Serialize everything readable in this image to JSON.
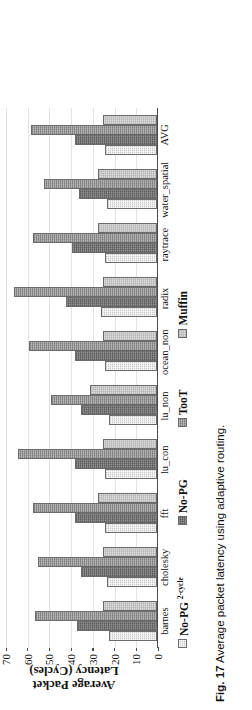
{
  "figure": {
    "caption_number": "Fig. 17",
    "caption_text": "Average packet latency using adaptive routing."
  },
  "axis": {
    "y_title_line1": "Average Packet",
    "y_title_line2": "Latency (Cycles)"
  },
  "legend": {
    "items": [
      {
        "label": "No-PG ",
        "sup": "2-cycle",
        "color": "#c8c8c8"
      },
      {
        "label": "No-PG",
        "sup": "",
        "color": "#6f6f6f"
      },
      {
        "label": "TooT",
        "sup": "",
        "color": "#8e8e8e"
      },
      {
        "label": "Muffin",
        "sup": "",
        "color": "#dcdcdc"
      }
    ]
  },
  "chart_data": {
    "type": "bar",
    "title": "",
    "xlabel": "",
    "ylabel": "Average Packet Latency (Cycles)",
    "ylim": [
      0,
      70
    ],
    "yticks": [
      0,
      10,
      20,
      30,
      40,
      50,
      60,
      70
    ],
    "ytick_labels": [
      "0",
      "10",
      "20",
      "30",
      "40",
      "50",
      "60",
      "70"
    ],
    "grid": true,
    "legend_position": "below",
    "categories": [
      "barnes",
      "cholesky",
      "fft",
      "lu_con",
      "lu_non",
      "ocean_non",
      "radix",
      "raytrace",
      "water_spatial",
      "AVG"
    ],
    "series": [
      {
        "name": "No-PG 2-cycle",
        "values": [
          22,
          23,
          24,
          24,
          22,
          24,
          26,
          24,
          23,
          24
        ]
      },
      {
        "name": "No-PG",
        "values": [
          37,
          35,
          38,
          38,
          35,
          38,
          42,
          39,
          36,
          38
        ]
      },
      {
        "name": "TooT",
        "values": [
          56,
          55,
          57,
          64,
          49,
          59,
          66,
          57,
          52,
          58
        ]
      },
      {
        "name": "Muffin",
        "values": [
          25,
          25,
          27,
          25,
          31,
          25,
          25,
          27,
          27,
          25
        ]
      }
    ]
  }
}
